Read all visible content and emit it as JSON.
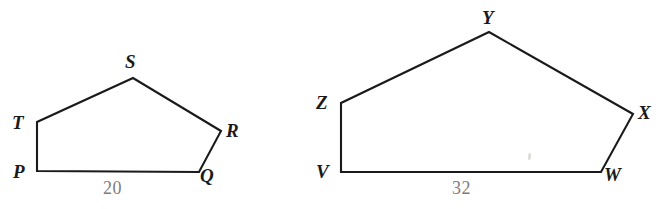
{
  "figure": {
    "background_color": "#ffffff",
    "stroke_color": "#1a1a1a",
    "label_color": "#1a1a1a",
    "measure_color": "#7d7d7d"
  },
  "pentagons": [
    {
      "name": "pentagon-pqrst",
      "vertices": [
        {
          "label": "P",
          "x": 37,
          "y": 171,
          "label_x": 13,
          "label_y": 162
        },
        {
          "label": "Q",
          "x": 199,
          "y": 172,
          "label_x": 200,
          "label_y": 166
        },
        {
          "label": "R",
          "x": 221,
          "y": 131,
          "label_x": 226,
          "label_y": 121
        },
        {
          "label": "S",
          "x": 133,
          "y": 78,
          "label_x": 125,
          "label_y": 52
        },
        {
          "label": "T",
          "x": 37,
          "y": 122,
          "label_x": 12,
          "label_y": 113
        }
      ],
      "base": {
        "from": "P",
        "to": "Q",
        "length": "20",
        "label_x": 103,
        "label_y": 179
      }
    },
    {
      "name": "pentagon-vwxyz",
      "vertices": [
        {
          "label": "V",
          "x": 341,
          "y": 172,
          "label_x": 316,
          "label_y": 162
        },
        {
          "label": "W",
          "x": 601,
          "y": 172,
          "label_x": 604,
          "label_y": 165
        },
        {
          "label": "X",
          "x": 633,
          "y": 114,
          "label_x": 638,
          "label_y": 103
        },
        {
          "label": "Y",
          "x": 489,
          "y": 32,
          "label_x": 482,
          "label_y": 8
        },
        {
          "label": "Z",
          "x": 341,
          "y": 103,
          "label_x": 316,
          "label_y": 93
        }
      ],
      "base": {
        "from": "V",
        "to": "W",
        "length": "32",
        "label_x": 452,
        "label_y": 179
      }
    }
  ],
  "artifacts": [
    {
      "name": "scan-smudge",
      "x": 528,
      "y": 153
    }
  ]
}
